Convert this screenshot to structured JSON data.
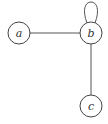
{
  "graph": {
    "nodes": [
      {
        "id": "a",
        "label": "a",
        "cx": 19,
        "cy": 33
      },
      {
        "id": "b",
        "label": "b",
        "cx": 91,
        "cy": 33
      },
      {
        "id": "c",
        "label": "c",
        "cx": 91,
        "cy": 106
      }
    ],
    "edges": [
      {
        "from": "a",
        "to": "b"
      },
      {
        "from": "b",
        "to": "c"
      },
      {
        "from": "b",
        "to": "b",
        "type": "self-loop"
      }
    ],
    "node_radius": 11,
    "colors": {
      "stroke": "#444444",
      "edge": "#555555",
      "fill": "#ffffff"
    }
  }
}
